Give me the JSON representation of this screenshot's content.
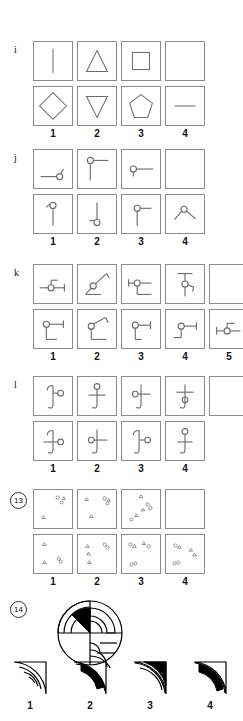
{
  "page": {
    "type": "non-verbal-reasoning-worksheet",
    "ink_color": "#6e6e6e",
    "solid_color": "#000000",
    "background": "#ffffff"
  },
  "sections": [
    {
      "id": "i",
      "label": "i",
      "label_style": "plain",
      "question_row": {
        "name": "question-row-i",
        "cells": [
          {
            "name": "cell-i-q1",
            "figure": "vertical-line"
          },
          {
            "name": "cell-i-q2",
            "figure": "triangle-up"
          },
          {
            "name": "cell-i-q3",
            "figure": "square"
          },
          {
            "name": "cell-i-q4",
            "figure": "empty-answer-box"
          }
        ]
      },
      "option_row": {
        "name": "option-row-i",
        "cells": [
          {
            "name": "cell-i-o1",
            "figure": "diamond"
          },
          {
            "name": "cell-i-o2",
            "figure": "triangle-down"
          },
          {
            "name": "cell-i-o3",
            "figure": "pentagon"
          },
          {
            "name": "cell-i-o4",
            "figure": "horizontal-line"
          }
        ]
      },
      "option_numbers": [
        "1",
        "2",
        "3",
        "4"
      ]
    },
    {
      "id": "j",
      "label": "j",
      "label_style": "plain",
      "question_row": {
        "name": "question-row-j",
        "cells": [
          {
            "name": "cell-j-q1",
            "figure": "horizontal-line-circle-right-stub-up"
          },
          {
            "name": "cell-j-q2",
            "figure": "vertical-line-circle-top-stub-right"
          },
          {
            "name": "cell-j-q3",
            "figure": "horizontal-line-circle-left-stub-down"
          },
          {
            "name": "cell-j-q4",
            "figure": "empty-answer-box"
          }
        ]
      },
      "option_row": {
        "name": "option-row-j",
        "cells": [
          {
            "name": "cell-j-o1",
            "figure": "vertical-line-circle-top-stub-left"
          },
          {
            "name": "cell-j-o2",
            "figure": "vertical-line-circle-bottom-stub-left"
          },
          {
            "name": "cell-j-o3",
            "figure": "vertical-line-circle-top-stub-right"
          },
          {
            "name": "cell-j-o4",
            "figure": "circle-top-two-diagonal-arms"
          }
        ]
      },
      "option_numbers": [
        "1",
        "2",
        "3",
        "4"
      ]
    },
    {
      "id": "k",
      "label": "k",
      "label_style": "plain",
      "question_row": {
        "name": "question-row-k",
        "cells": [
          {
            "name": "cell-k-q1",
            "figure": "circle-on-horizontal-line-stub-up-right"
          },
          {
            "name": "cell-k-q2",
            "figure": "circle-diagonal-line-up-right-hook"
          },
          {
            "name": "cell-k-q3",
            "figure": "circle-horizontal-line-right-stub-down"
          },
          {
            "name": "cell-k-q4",
            "figure": "circle-vertical-line-crossbar-top-hook-right"
          },
          {
            "name": "cell-k-q5",
            "figure": "empty-answer-box"
          }
        ]
      },
      "option_row": {
        "name": "option-row-k",
        "cells": [
          {
            "name": "cell-k-o1",
            "figure": "circle-arm-right-leg-down"
          },
          {
            "name": "cell-k-o2",
            "figure": "circle-diagonal-arm-up-right-leg-down"
          },
          {
            "name": "cell-k-o3",
            "figure": "circle-arm-right-leg-down-short"
          },
          {
            "name": "cell-k-o4",
            "figure": "circle-arm-right-leg-down-left"
          },
          {
            "name": "cell-k-o5",
            "figure": "circle-on-horizontal-line-stub-up-right"
          }
        ]
      },
      "option_numbers": [
        "1",
        "2",
        "3",
        "4",
        "5"
      ]
    },
    {
      "id": "l",
      "label": "l",
      "label_style": "plain",
      "question_row": {
        "name": "question-row-l",
        "cells": [
          {
            "name": "cell-l-q1",
            "figure": "anchor-hook-top-circle-right-middle"
          },
          {
            "name": "cell-l-q2",
            "figure": "anchor-circle-top-crossbar-middle"
          },
          {
            "name": "cell-l-q3",
            "figure": "anchor-circle-left-crossbar-middle"
          },
          {
            "name": "cell-l-q4",
            "figure": "anchor-crossbar-top-circle-below"
          }
        ]
      },
      "option_row": {
        "name": "option-row-l",
        "cells": [
          {
            "name": "cell-l-o1",
            "figure": "anchor-circle-right-crossbar-low"
          },
          {
            "name": "cell-l-o2",
            "figure": "anchor-circle-left-crossbar-middle"
          },
          {
            "name": "cell-l-o3",
            "figure": "anchor-hook-top-circle-right"
          },
          {
            "name": "cell-l-o4",
            "figure": "anchor-circle-top-crossbar-middle"
          }
        ]
      },
      "extra_cell": {
        "name": "cell-l-q5",
        "figure": "empty-answer-box"
      },
      "option_numbers": [
        "1",
        "2",
        "3",
        "4"
      ]
    },
    {
      "id": "13",
      "label": "13",
      "label_style": "circled",
      "question_row": {
        "name": "question-row-13",
        "cells": [
          {
            "name": "cell-13-q1",
            "figure": "scatter-triangles-circles-a"
          },
          {
            "name": "cell-13-q2",
            "figure": "scatter-triangles-circles-b"
          },
          {
            "name": "cell-13-q3",
            "figure": "scatter-triangles-circles-diagonal"
          },
          {
            "name": "cell-13-q4",
            "figure": "empty-answer-box"
          }
        ]
      },
      "option_row": {
        "name": "option-row-13",
        "cells": [
          {
            "name": "cell-13-o1",
            "figure": "scatter-option-1"
          },
          {
            "name": "cell-13-o2",
            "figure": "scatter-option-2"
          },
          {
            "name": "cell-13-o3",
            "figure": "scatter-option-3"
          },
          {
            "name": "cell-13-o4",
            "figure": "scatter-option-4"
          }
        ]
      },
      "option_numbers": [
        "1",
        "2",
        "3",
        "4"
      ]
    },
    {
      "id": "14",
      "label": "14",
      "label_style": "circled",
      "question_figure": {
        "name": "wheel-diagram",
        "figure": "circle-four-quadrants-concentric-arcs-black-wedge-upper-left"
      },
      "option_row": {
        "name": "option-row-14",
        "cells": [
          {
            "name": "cell-14-o1",
            "figure": "quarter-wedge-arcs-no-fill"
          },
          {
            "name": "cell-14-o2",
            "figure": "quarter-wedge-black-inner-band"
          },
          {
            "name": "cell-14-o3",
            "figure": "quarter-wedge-black-outer-large"
          },
          {
            "name": "cell-14-o4",
            "figure": "quarter-wedge-black-middle-band"
          }
        ]
      },
      "option_numbers": [
        "1",
        "2",
        "3",
        "4"
      ]
    }
  ]
}
